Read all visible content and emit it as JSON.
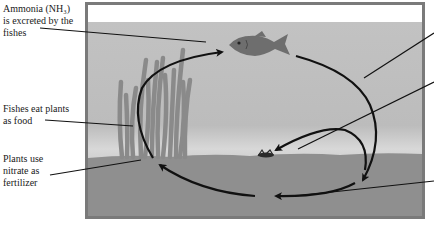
{
  "diagram": {
    "labels": {
      "ammonia_line1": "Ammonia (NH₃)",
      "ammonia_line2": "is excreted by the",
      "ammonia_line3": "fishes",
      "fish_eat_line1": "Fishes eat plants",
      "fish_eat_line2": "as food",
      "plants_line1": "Plants use",
      "plants_line2": "nitrate as",
      "plants_line3": "fertilizer"
    },
    "right_labels_visible": false,
    "colors": {
      "frame": "#7a7a7a",
      "air": "#ffffff",
      "water": "#bdbdbd",
      "water_light": "#d4d4d4",
      "sediment": "#8f8f8f",
      "plants": "#8a8a8a",
      "fish": "#6e6e6e",
      "arrows": "#111111",
      "text": "#1a1a1a"
    },
    "elements": [
      "fish",
      "plants",
      "cycle-arrows",
      "bacteria-deposit",
      "sediment"
    ]
  }
}
